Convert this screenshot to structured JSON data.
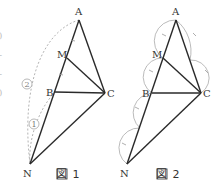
{
  "left_margin_marks": [
    "(",
    ")",
    "-",
    "-",
    ")"
  ],
  "figure1": {
    "caption": "図 1",
    "points": {
      "A": {
        "label": "A",
        "x": 79,
        "y": 20
      },
      "M": {
        "label": "M",
        "x": 67,
        "y": 58
      },
      "B": {
        "label": "B",
        "x": 55,
        "y": 92
      },
      "C": {
        "label": "C",
        "x": 105,
        "y": 93
      },
      "N": {
        "label": "N",
        "x": 30,
        "y": 164
      }
    },
    "arc_labels": {
      "outer": "②",
      "inner": "①"
    }
  },
  "figure2": {
    "caption": "図 2",
    "points": {
      "A": {
        "label": "A",
        "x": 176,
        "y": 20
      },
      "M": {
        "label": "M",
        "x": 163,
        "y": 58
      },
      "B": {
        "label": "B",
        "x": 152,
        "y": 93
      },
      "C": {
        "label": "C",
        "x": 201,
        "y": 93
      },
      "N": {
        "label": "N",
        "x": 127,
        "y": 164
      }
    }
  },
  "colors": {
    "line": "#2a2a2a",
    "construction": "#aaaaaa",
    "text": "#333333"
  }
}
